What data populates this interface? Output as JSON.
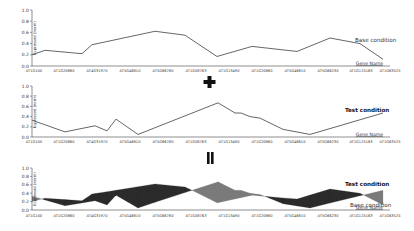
{
  "chart_data": [
    {
      "type": "line",
      "title": "",
      "xlabel": "Gene Name",
      "ylabel": "Expressed (norm)",
      "ylim": [
        0.0,
        1.0
      ],
      "yticks": [
        "0.0",
        "0.2",
        "0.4",
        "0.6",
        "0.8",
        "1.0"
      ],
      "categories": [
        "AT1G100",
        "AT1G20860",
        "AT4G31970",
        "AT5G46810",
        "AT5G66780",
        "AT1G08763",
        "AT1G13490",
        "AT1G20860",
        "AT5G46810",
        "AT5G66230",
        "AT1G125163",
        "AT1G63525"
      ],
      "series": [
        {
          "name": "Base condition",
          "x": [
            32,
            45,
            82,
            92,
            155,
            185,
            217,
            252,
            297,
            330,
            360,
            383
          ],
          "values": [
            0.2,
            0.28,
            0.22,
            0.38,
            0.62,
            0.55,
            0.17,
            0.35,
            0.26,
            0.5,
            0.4,
            0.12
          ]
        }
      ]
    },
    {
      "type": "line",
      "title": "",
      "xlabel": "Gene Name",
      "ylabel": "Expressed (norm)",
      "ylim": [
        0.0,
        1.0
      ],
      "yticks": [
        "0.0",
        "0.2",
        "0.4",
        "0.6",
        "0.8",
        "1.0"
      ],
      "categories": [
        "AT1G100",
        "AT1G20860",
        "AT4G31970",
        "AT5G46810",
        "AT5G66780",
        "AT1G08763",
        "AT1G13490",
        "AT1G20860",
        "AT5G46810",
        "AT5G66230",
        "AT1G125163",
        "AT1G63525"
      ],
      "series": [
        {
          "name": "Test condition",
          "x": [
            32,
            65,
            95,
            107,
            116,
            138,
            218,
            235,
            241,
            250,
            260,
            283,
            310,
            383
          ],
          "values": [
            0.33,
            0.1,
            0.22,
            0.12,
            0.35,
            0.05,
            0.67,
            0.47,
            0.47,
            0.4,
            0.37,
            0.15,
            0.05,
            0.47
          ]
        }
      ]
    },
    {
      "type": "area",
      "title": "",
      "xlabel": "Gene Name",
      "ylabel": "Expressed (norm)",
      "ylim": [
        0.0,
        1.0
      ],
      "yticks": [
        "0.0",
        "0.2",
        "0.4",
        "0.6",
        "0.8",
        "1.0"
      ],
      "categories": [
        "AT1G100",
        "AT1G20860",
        "AT4G31970",
        "AT5G46810",
        "AT5G66780",
        "AT1G08763",
        "AT1G13490",
        "AT1G20860",
        "AT5G46810",
        "AT5G66230",
        "AT1G125163",
        "AT1G63525"
      ],
      "series": [
        {
          "name": "Test condition",
          "ref": 1
        },
        {
          "name": "Base condition",
          "ref": 0
        }
      ],
      "fill_colors": {
        "test_above": "#7a7a7a",
        "base_above": "#2b2b2b"
      }
    }
  ],
  "operators": {
    "plus": "+",
    "equals": "="
  },
  "panels": [
    {
      "series_label": "Base condition",
      "x_label": "Gene Name",
      "y_label": "Expressed (norm)"
    },
    {
      "series_label": "Test condition",
      "x_label": "Gene Name",
      "y_label": "Expressed (norm)"
    },
    {
      "series_label_top": "Test condition",
      "series_label_bottom": "Base condition",
      "x_label": "Gene Name",
      "y_label": "Expressed (norm)"
    }
  ],
  "colors": {
    "line": "#555555",
    "axis": "#444444",
    "dark_fill": "#2b2b2b",
    "light_fill": "#7a7a7a"
  }
}
